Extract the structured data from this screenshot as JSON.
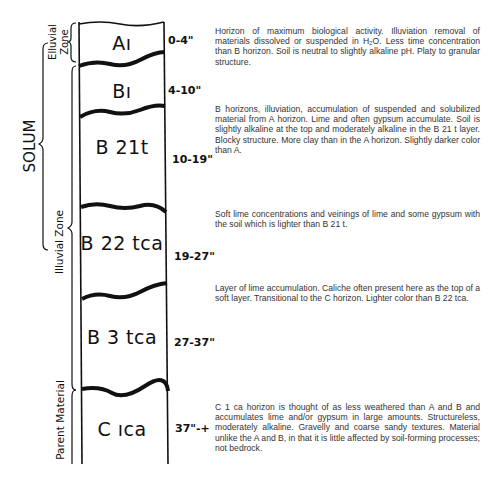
{
  "diagram": {
    "side_labels": {
      "solum": "SOLUM",
      "elluvial_line1": "Elluvial",
      "elluvial_line2": "Zone",
      "illuvial": "Illuvial  Zone",
      "parent": "Parent  Material"
    },
    "horizons": [
      {
        "name": "A1",
        "label": "Aı",
        "depth": "0-4\"",
        "description": "Horizon of maximum biological activity. Illuviation removal of materials dissolved or suspended in H₂O. Less time concentration than B horizon. Soil is neutral to slightly alkaline pH. Platy to granular structure."
      },
      {
        "name": "B1",
        "label": "Bı",
        "depth": "4-10\"",
        "description": "B horizons, illuviation, accumulation of suspended and solubilized material from A horizon. Lime and often gypsum accumulate. Soil is slightly alkaline at the top and moderately alkaline in the B 21 t layer. Blocky structure. More clay than in the A horizon. Slightly darker color than A."
      },
      {
        "name": "B21t",
        "label": "B 21t",
        "depth": "10-19\"",
        "description": ""
      },
      {
        "name": "B22tca",
        "label": "B 22 tca",
        "depth": "19-27\"",
        "description": "Soft lime concentrations and veinings of lime and some gypsum with the soil which is lighter than B 21 t."
      },
      {
        "name": "B3tca",
        "label": "B 3 tca",
        "depth": "27-37\"",
        "description": "Layer of lime accumulation. Caliche often present here as the top of a soft layer. Transitional to the C horizon. Lighter color than B 22 tca."
      },
      {
        "name": "C1ca",
        "label": "C ıca",
        "depth": "37\"-+",
        "description": "C 1 ca horizon is thought of as less weathered than A and B and accumulates lime and/or gypsum in large amounts. Structureless, moderately alkaline. Gravelly and coarse sandy textures. Material unlike the A and B, in that it is little affected by soil-forming processes; not bedrock."
      }
    ]
  }
}
